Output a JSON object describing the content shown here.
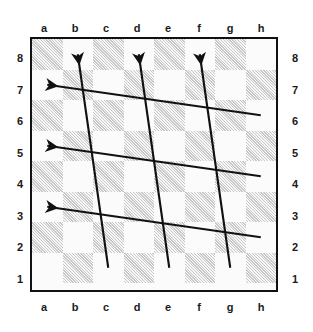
{
  "diagram": {
    "kind": "chessboard-diagram",
    "board_size": 8,
    "light_square_color": "#fbfbfb",
    "dark_square_color": "#c9c9c9",
    "border_color": "#111111",
    "arrow_color": "#111111",
    "dark_square_fill": "hatched"
  },
  "labels": {
    "files_top": [
      "a",
      "b",
      "c",
      "d",
      "e",
      "f",
      "g",
      "h"
    ],
    "files_bottom": [
      "a",
      "b",
      "c",
      "d",
      "e",
      "f",
      "g",
      "h"
    ],
    "ranks_left": [
      "8",
      "7",
      "6",
      "5",
      "4",
      "3",
      "2",
      "1"
    ],
    "ranks_right": [
      "8",
      "7",
      "6",
      "5",
      "4",
      "3",
      "2",
      "1"
    ]
  },
  "arrows": [
    {
      "id": "arrow-1",
      "from": "c1",
      "to": "b8",
      "direction": "up-left",
      "head": "b8"
    },
    {
      "id": "arrow-2",
      "from": "e1",
      "to": "d8",
      "direction": "up-left",
      "head": "d8"
    },
    {
      "id": "arrow-3",
      "from": "g1",
      "to": "f8",
      "direction": "up-left",
      "head": "f8"
    },
    {
      "id": "arrow-4",
      "from": "h6",
      "to": "a7",
      "direction": "up-left",
      "head": "a7"
    },
    {
      "id": "arrow-5",
      "from": "h4",
      "to": "a5",
      "direction": "up-left",
      "head": "a5"
    },
    {
      "id": "arrow-6",
      "from": "h2",
      "to": "a3",
      "direction": "up-left",
      "head": "a3"
    }
  ],
  "chart_data": {
    "type": "diagram",
    "categories": [
      "a",
      "b",
      "c",
      "d",
      "e",
      "f",
      "g",
      "h"
    ],
    "rows": [
      "8",
      "7",
      "6",
      "5",
      "4",
      "3",
      "2",
      "1"
    ],
    "grid": true,
    "legend": "none",
    "annotations": [
      "c1 to b8",
      "e1 to d8",
      "g1 to f8",
      "h6 to a7",
      "h4 to a5",
      "h2 to a3"
    ]
  }
}
